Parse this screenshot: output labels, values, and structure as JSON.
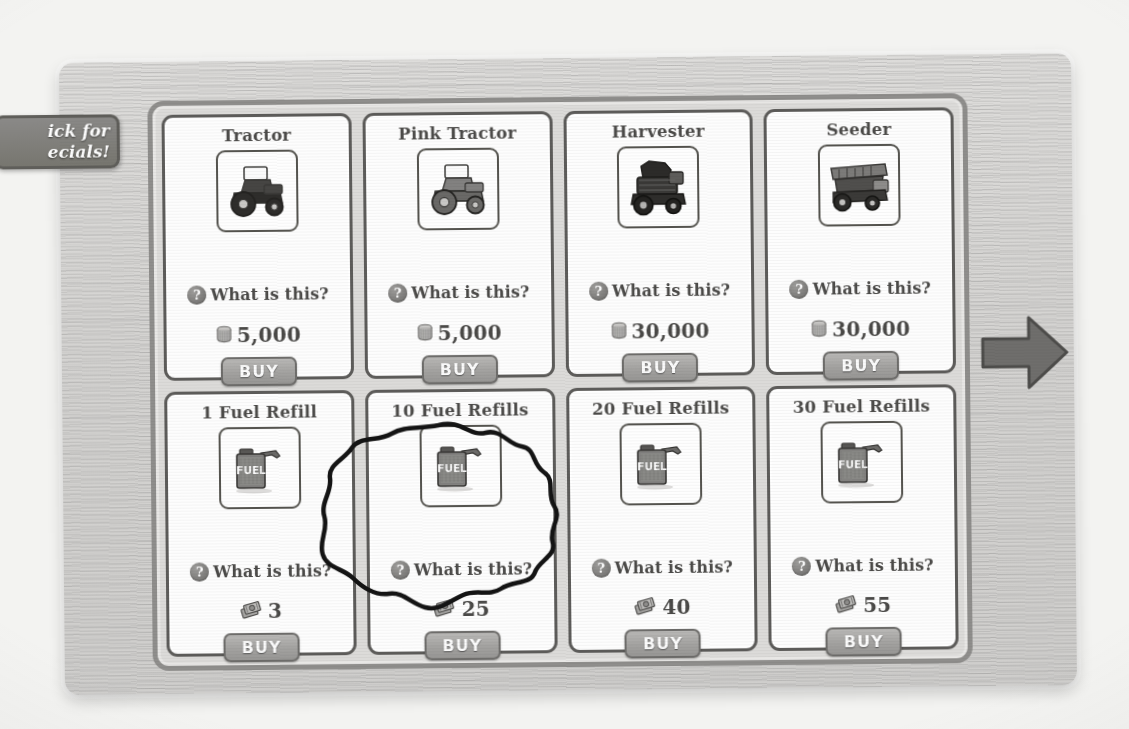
{
  "window": {
    "specials_tab": {
      "name": "click-for-specials-tab",
      "line1": "ick for",
      "line2": "ecials!",
      "full_text": "Click for Specials!"
    },
    "next_arrow_label": "Next page"
  },
  "shop": {
    "buy_label": "BUY",
    "what_is_this_label": "What is this?",
    "question_glyph": "?",
    "currency": {
      "coin_name": "coins-icon",
      "cash_name": "farm-cash-icon"
    },
    "items": [
      {
        "title": "Tractor",
        "icon": "tractor-icon",
        "price": "5,000",
        "currency": "coins",
        "help": "What is this?",
        "buy": "BUY"
      },
      {
        "title": "Pink Tractor",
        "icon": "pink-tractor-icon",
        "price": "5,000",
        "currency": "coins",
        "help": "What is this?",
        "buy": "BUY"
      },
      {
        "title": "Harvester",
        "icon": "harvester-icon",
        "price": "30,000",
        "currency": "coins",
        "help": "What is this?",
        "buy": "BUY"
      },
      {
        "title": "Seeder",
        "icon": "seeder-icon",
        "price": "30,000",
        "currency": "coins",
        "help": "What is this?",
        "buy": "BUY"
      },
      {
        "title": "1 Fuel Refill",
        "icon": "fuel-can-icon",
        "price": "3",
        "currency": "cash",
        "help": "What is this?",
        "buy": "BUY",
        "annotated": true
      },
      {
        "title": "10 Fuel Refills",
        "icon": "fuel-can-icon",
        "price": "25",
        "currency": "cash",
        "help": "What is this?",
        "buy": "BUY"
      },
      {
        "title": "20 Fuel Refills",
        "icon": "fuel-can-icon",
        "price": "40",
        "currency": "cash",
        "help": "What is this?",
        "buy": "BUY"
      },
      {
        "title": "30 Fuel Refills",
        "icon": "fuel-can-icon",
        "price": "55",
        "currency": "cash",
        "help": "What is this?",
        "buy": "BUY"
      }
    ]
  },
  "fuel_can_text": "FUEL",
  "colors": {
    "page_background": "#f3f3f1",
    "wood_panel": "#d6d5d3",
    "panel_inner": "#dcdbd9",
    "card_background": "#fdfdfd",
    "card_border": "#5d5c5a",
    "text": "#4b4a48",
    "buy_button": "#a3a2a0",
    "buy_text": "#fbfbfb",
    "annotation_ink": "#141414"
  }
}
